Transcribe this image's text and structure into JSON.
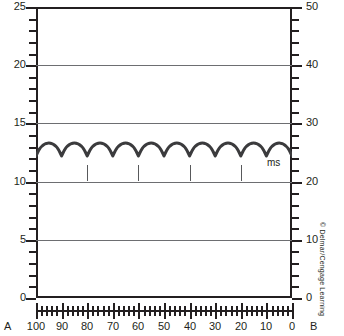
{
  "figure": {
    "panel_left_label": "A",
    "panel_right_label": "B",
    "credit": "© Delmar/Cengage Learning",
    "time_unit_label": "ms",
    "trace_color": "#3b3b3d",
    "grid_color": "#6d6e71",
    "frame_color": "#231f20"
  },
  "chart_data": {
    "type": "line",
    "title": "",
    "xlabel": "",
    "ylabel": "",
    "grid": true,
    "legend": null,
    "axes": {
      "x": {
        "ticks": [
          100,
          90,
          80,
          70,
          60,
          50,
          40,
          30,
          20,
          10,
          0
        ],
        "labels": [
          "100",
          "90",
          "80",
          "70",
          "60",
          "50",
          "40",
          "30",
          "20",
          "10",
          "0"
        ],
        "lim": [
          100,
          0
        ],
        "direction": "reversed",
        "minor_per_major": 5
      },
      "y_left": {
        "ticks": [
          25,
          20,
          15,
          10,
          5,
          0
        ],
        "labels": [
          "25",
          "20",
          "15",
          "10",
          "5",
          "0"
        ],
        "lim": [
          0,
          25
        ],
        "minor_per_major": 5,
        "gridlines_at": [
          20,
          15,
          10,
          5
        ]
      },
      "y_right": {
        "ticks": [
          50,
          40,
          30,
          20,
          10,
          0
        ],
        "labels": [
          "50",
          "40",
          "30",
          "20",
          "10",
          "0"
        ],
        "lim": [
          0,
          50
        ],
        "minor_per_major": 5
      }
    },
    "series": [
      {
        "name": "pulse-trace",
        "waveform": "repeating-arches",
        "cycles": 10,
        "peak_y_left": 13.7,
        "trough_y_left": 12.2,
        "peak_y_right": 27.4,
        "trough_y_right": 24.4,
        "x_start": 100,
        "x_end": 0
      }
    ],
    "timing_marks": {
      "count": 4,
      "x_positions": [
        80,
        60,
        40,
        20
      ],
      "y_top_left_units": 11.4,
      "y_bottom_left_units": 10.0
    }
  }
}
